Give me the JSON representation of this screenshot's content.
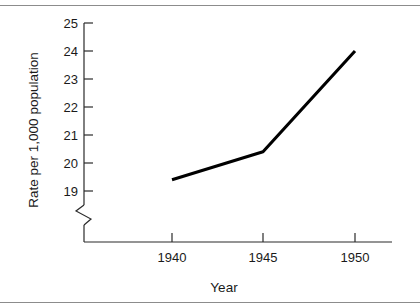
{
  "figure": {
    "has_top_rule": true,
    "has_bottom_rule": true,
    "rule_color": "#8c8c8c",
    "background": "#ffffff"
  },
  "chart_data": {
    "type": "line",
    "title": "",
    "xlabel": "Year",
    "ylabel": "Rate per 1,000 population",
    "x": [
      1940,
      1945,
      1950
    ],
    "values": [
      19.4,
      20.4,
      24.0
    ],
    "series": [
      {
        "name": "Rate",
        "values": [
          19.4,
          20.4,
          24.0
        ],
        "color": "#000000",
        "line_width": 3
      }
    ],
    "xtick_labels": [
      "1940",
      "1945",
      "1950"
    ],
    "xticks": [
      1940,
      1945,
      1950
    ],
    "ytick_labels": [
      "19",
      "20",
      "21",
      "22",
      "23",
      "24",
      "25"
    ],
    "yticks": [
      19,
      20,
      21,
      22,
      23,
      24,
      25
    ],
    "ylim": [
      19,
      25
    ],
    "xlim": [
      1938,
      1952
    ],
    "y_axis_break": true,
    "y_axis_break_note": "zigzag break below 19",
    "grid": false,
    "legend": false,
    "markers": false
  },
  "labels": {
    "y0": "19",
    "y1": "20",
    "y2": "21",
    "y3": "22",
    "y4": "23",
    "y5": "24",
    "y6": "25",
    "x0": "1940",
    "x1": "1945",
    "x2": "1950",
    "x_axis_title": "Year",
    "y_axis_title": "Rate per 1,000 population"
  }
}
